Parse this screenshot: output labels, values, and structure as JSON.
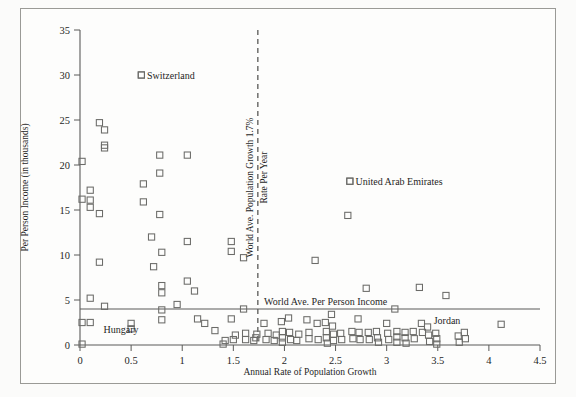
{
  "figure": {
    "background": "#fbfbfa",
    "frame_color": "#9a9a96",
    "marker_color": "#6b6b68",
    "axis_color": "#5a5a58"
  },
  "chart_data": {
    "type": "scatter",
    "title": "",
    "xlabel": "Annual Rate of Population Growth",
    "ylabel": "Per Person Income (in thousands)",
    "xlim": [
      0,
      4.5
    ],
    "ylim": [
      0,
      35
    ],
    "xticks": [
      0,
      0.5,
      1,
      1.5,
      2,
      2.5,
      3,
      3.5,
      4,
      4.5
    ],
    "xticklabels": [
      "0",
      "0.5",
      "1",
      "1.5",
      "2",
      "2.5",
      "3",
      "3.5",
      "4",
      "4.5"
    ],
    "yticks": [
      0,
      5,
      10,
      15,
      20,
      25,
      30,
      35
    ],
    "yticklabels": [
      "0",
      "5",
      "10",
      "15",
      "20",
      "25",
      "30",
      "35"
    ],
    "grid": false,
    "legend": false,
    "marker_style": "open-square",
    "reference_lines": [
      {
        "name": "world-ave-population-growth",
        "orientation": "vertical",
        "value": 1.74,
        "style": "dashed",
        "label_line1": "World Ave. Population Growth 1.7%",
        "label_line2": "Rate Per Year"
      },
      {
        "name": "world-ave-per-person-income",
        "orientation": "horizontal",
        "value": 4.0,
        "style": "solid",
        "label": "World Ave. Per Person Income"
      }
    ],
    "annotations": [
      {
        "name": "switzerland",
        "text": "Switzerland",
        "x": 0.6,
        "y": 30.0,
        "has_marker": true
      },
      {
        "name": "united-arab-emirates",
        "text": "United Arab Emirates",
        "x": 2.64,
        "y": 18.2,
        "has_marker": true
      },
      {
        "name": "hungary",
        "text": "Hungary",
        "x": 0.23,
        "y": 1.35,
        "has_marker": false
      },
      {
        "name": "jordan",
        "text": "Jordan",
        "x": 3.46,
        "y": 2.35,
        "has_marker": false
      }
    ],
    "points": [
      [
        0.02,
        20.4
      ],
      [
        0.02,
        16.2
      ],
      [
        0.02,
        2.5
      ],
      [
        0.02,
        0.1
      ],
      [
        0.1,
        17.2
      ],
      [
        0.1,
        16.1
      ],
      [
        0.1,
        15.3
      ],
      [
        0.1,
        5.2
      ],
      [
        0.1,
        2.5
      ],
      [
        0.19,
        24.7
      ],
      [
        0.19,
        14.6
      ],
      [
        0.19,
        9.2
      ],
      [
        0.24,
        23.9
      ],
      [
        0.24,
        21.9
      ],
      [
        0.24,
        22.2
      ],
      [
        0.24,
        4.3
      ],
      [
        0.5,
        2.4
      ],
      [
        0.5,
        1.8
      ],
      [
        0.6,
        30.0
      ],
      [
        0.62,
        17.9
      ],
      [
        0.62,
        15.9
      ],
      [
        0.7,
        12.0
      ],
      [
        0.72,
        8.7
      ],
      [
        0.78,
        21.1
      ],
      [
        0.78,
        19.1
      ],
      [
        0.78,
        14.5
      ],
      [
        0.8,
        6.6
      ],
      [
        0.8,
        10.3
      ],
      [
        0.8,
        5.8
      ],
      [
        0.8,
        3.9
      ],
      [
        0.8,
        2.8
      ],
      [
        0.95,
        4.5
      ],
      [
        1.05,
        11.5
      ],
      [
        1.05,
        21.1
      ],
      [
        1.05,
        7.1
      ],
      [
        1.12,
        6.0
      ],
      [
        1.15,
        2.9
      ],
      [
        1.22,
        2.4
      ],
      [
        1.32,
        1.6
      ],
      [
        1.4,
        0.1
      ],
      [
        1.42,
        0.5
      ],
      [
        1.48,
        11.5
      ],
      [
        1.48,
        10.4
      ],
      [
        1.48,
        2.9
      ],
      [
        1.5,
        0.6
      ],
      [
        1.52,
        1.1
      ],
      [
        1.6,
        9.7
      ],
      [
        1.6,
        4.0
      ],
      [
        1.62,
        1.3
      ],
      [
        1.62,
        0.6
      ],
      [
        1.7,
        0.5
      ],
      [
        1.72,
        0.8
      ],
      [
        1.73,
        1.2
      ],
      [
        1.8,
        2.4
      ],
      [
        1.82,
        0.6
      ],
      [
        1.84,
        1.3
      ],
      [
        1.9,
        0.5
      ],
      [
        1.92,
        1.1
      ],
      [
        1.97,
        2.6
      ],
      [
        1.98,
        1.5
      ],
      [
        1.98,
        0.8
      ],
      [
        1.98,
        0.3
      ],
      [
        2.04,
        3.0
      ],
      [
        2.05,
        1.4
      ],
      [
        2.06,
        0.6
      ],
      [
        2.12,
        0.5
      ],
      [
        2.14,
        1.2
      ],
      [
        2.22,
        2.8
      ],
      [
        2.24,
        1.4
      ],
      [
        2.24,
        0.7
      ],
      [
        2.3,
        9.4
      ],
      [
        2.32,
        2.4
      ],
      [
        2.33,
        0.6
      ],
      [
        2.4,
        2.5
      ],
      [
        2.41,
        1.5
      ],
      [
        2.41,
        0.8
      ],
      [
        2.42,
        0.2
      ],
      [
        2.46,
        3.4
      ],
      [
        2.47,
        2.1
      ],
      [
        2.48,
        1.2
      ],
      [
        2.48,
        0.5
      ],
      [
        2.55,
        1.3
      ],
      [
        2.56,
        0.6
      ],
      [
        2.62,
        14.4
      ],
      [
        2.64,
        18.2
      ],
      [
        2.66,
        1.5
      ],
      [
        2.67,
        0.7
      ],
      [
        2.72,
        2.9
      ],
      [
        2.73,
        1.4
      ],
      [
        2.74,
        0.6
      ],
      [
        2.8,
        6.3
      ],
      [
        2.82,
        1.4
      ],
      [
        2.83,
        0.6
      ],
      [
        2.9,
        1.5
      ],
      [
        2.91,
        0.8
      ],
      [
        2.92,
        0.3
      ],
      [
        3.0,
        2.4
      ],
      [
        3.01,
        1.3
      ],
      [
        3.02,
        0.6
      ],
      [
        3.08,
        4.0
      ],
      [
        3.1,
        1.5
      ],
      [
        3.1,
        0.9
      ],
      [
        3.1,
        0.3
      ],
      [
        3.18,
        1.4
      ],
      [
        3.18,
        0.8
      ],
      [
        3.19,
        0.2
      ],
      [
        3.26,
        1.5
      ],
      [
        3.27,
        0.7
      ],
      [
        3.32,
        6.4
      ],
      [
        3.34,
        2.4
      ],
      [
        3.35,
        1.4
      ],
      [
        3.4,
        2.0
      ],
      [
        3.41,
        1.1
      ],
      [
        3.42,
        0.4
      ],
      [
        3.48,
        1.3
      ],
      [
        3.49,
        0.7
      ],
      [
        3.49,
        0.1
      ],
      [
        3.58,
        5.5
      ],
      [
        3.7,
        1.0
      ],
      [
        3.71,
        0.3
      ],
      [
        3.76,
        1.4
      ],
      [
        3.77,
        0.7
      ],
      [
        4.12,
        2.3
      ]
    ]
  }
}
